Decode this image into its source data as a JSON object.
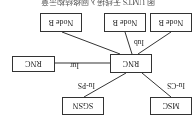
{
  "diagram": {
    "orientation": "rotated-180",
    "caption": "图 UMTS 无线接入网络结构示意",
    "nodes": {
      "node_b_1": "Node B",
      "node_b_2": "Node B",
      "node_b_3": "Node B",
      "rnc_main": "RNC",
      "rnc_peer": "RNC",
      "sgsn": "SGSN",
      "msc": "MSC"
    },
    "interfaces": {
      "iub": "Iub",
      "iur": "Iur",
      "iu_ps": "Iu-PS",
      "iu_cs": "Iu-CS"
    },
    "edges": [
      {
        "from": "rnc_main",
        "to": "node_b_1",
        "label": ""
      },
      {
        "from": "rnc_main",
        "to": "node_b_2",
        "label": "Iub"
      },
      {
        "from": "rnc_main",
        "to": "node_b_3",
        "label": ""
      },
      {
        "from": "rnc_main",
        "to": "rnc_peer",
        "label": "Iur"
      },
      {
        "from": "rnc_main",
        "to": "sgsn",
        "label": "Iu-PS"
      },
      {
        "from": "rnc_main",
        "to": "msc",
        "label": "Iu-CS"
      }
    ]
  }
}
